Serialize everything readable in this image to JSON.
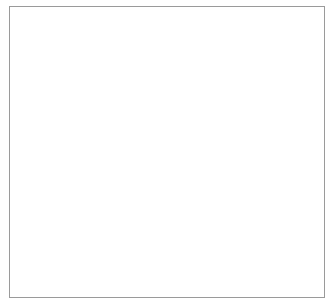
{
  "chart_data": {
    "type": "line",
    "title": "",
    "xlabel": "Time in years following treatment",
    "ylabel": "Percent free",
    "xlim": [
      0,
      4
    ],
    "ylim": [
      0,
      100
    ],
    "xticks": [
      "0",
      "1",
      "2",
      "3",
      "4"
    ],
    "yticks": [
      "0",
      "10",
      "20",
      "30",
      "40",
      "50",
      "60",
      "70",
      "80",
      "90",
      "100"
    ],
    "grid": false,
    "legend_position": "lower-left-inside",
    "series": [
      {
        "name": "Monotherapy",
        "style": "solid",
        "color": "#4a4a4a",
        "points": [
          [
            0.0,
            100
          ],
          [
            0.3,
            100
          ],
          [
            0.32,
            99.3
          ],
          [
            0.55,
            99.3
          ],
          [
            0.57,
            98.6
          ],
          [
            1.05,
            98.6
          ],
          [
            1.08,
            97.2
          ],
          [
            1.22,
            97.2
          ],
          [
            1.25,
            96.0
          ],
          [
            1.45,
            96.0
          ],
          [
            1.48,
            95.0
          ],
          [
            1.62,
            95.0
          ],
          [
            1.66,
            94.2
          ],
          [
            1.78,
            94.2
          ],
          [
            1.8,
            91.3
          ],
          [
            2.2,
            91.3
          ],
          [
            2.24,
            90.8
          ],
          [
            4.0,
            90.8
          ]
        ]
      },
      {
        "name": "Combined therapy",
        "style": "dashed",
        "color": "#4a4a4a",
        "points": [
          [
            0.0,
            100
          ],
          [
            0.42,
            100
          ],
          [
            0.45,
            98.5
          ],
          [
            0.6,
            98.5
          ],
          [
            0.62,
            96.0
          ],
          [
            0.72,
            96.0
          ],
          [
            0.75,
            94.0
          ],
          [
            0.84,
            94.0
          ],
          [
            0.87,
            91.5
          ],
          [
            0.95,
            91.5
          ],
          [
            0.98,
            89.0
          ],
          [
            1.04,
            89.0
          ],
          [
            1.07,
            86.0
          ],
          [
            1.12,
            86.0
          ],
          [
            1.15,
            82.5
          ],
          [
            1.2,
            82.5
          ],
          [
            1.23,
            79.5
          ],
          [
            1.3,
            79.5
          ],
          [
            1.33,
            77.0
          ],
          [
            1.42,
            77.0
          ],
          [
            1.45,
            70.2
          ],
          [
            4.0,
            70.2
          ]
        ]
      }
    ],
    "risk_table": {
      "caption": "Number at risk",
      "times": [
        "0",
        "1",
        "2",
        "3",
        "4"
      ],
      "rows": [
        {
          "series": "Monotherapy",
          "counts": [
            "151",
            "142",
            "99",
            "63",
            "20"
          ]
        },
        {
          "series": "Combined therapy",
          "counts": [
            "50",
            "38",
            "24",
            "15",
            "4"
          ]
        }
      ]
    }
  },
  "legend": {
    "items": [
      {
        "label": "Monotherapy",
        "style": "solid"
      },
      {
        "label": "Combined therapy",
        "style": "dashed"
      }
    ]
  }
}
